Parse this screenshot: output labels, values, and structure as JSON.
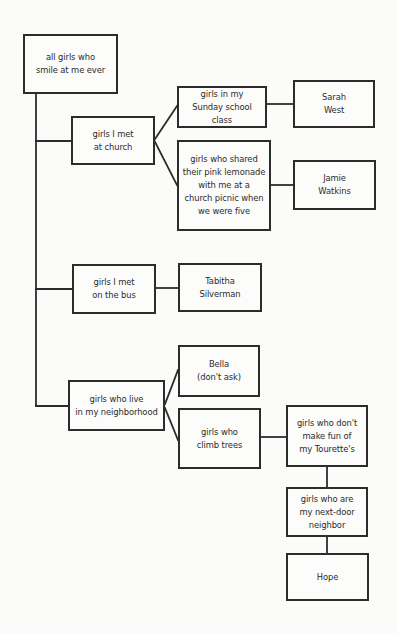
{
  "diagram": {
    "type": "tree",
    "line_color": "#2c2c2c",
    "background_color": "#fbfbf9",
    "nodes": {
      "root": {
        "label": "all girls who\nsmile at me ever",
        "x": 23,
        "y": 34,
        "w": 95,
        "h": 60
      },
      "church": {
        "label": "girls I met\nat church",
        "x": 71,
        "y": 116,
        "w": 84,
        "h": 49
      },
      "sunday_school": {
        "label": "girls in my\nSunday school class",
        "x": 177,
        "y": 86,
        "w": 90,
        "h": 42
      },
      "sarah_west": {
        "label": "Sarah\nWest",
        "x": 293,
        "y": 80,
        "w": 82,
        "h": 48
      },
      "pink_lemonade": {
        "label": "girls who shared\ntheir pink lemonade\nwith me at a\nchurch picnic when\nwe were five",
        "x": 177,
        "y": 140,
        "w": 94,
        "h": 91
      },
      "jamie_watkins": {
        "label": "Jamie\nWatkins",
        "x": 293,
        "y": 160,
        "w": 83,
        "h": 50
      },
      "bus": {
        "label": "girls I met\non the bus",
        "x": 72,
        "y": 264,
        "w": 84,
        "h": 50
      },
      "tabitha_silverman": {
        "label": "Tabitha\nSilverman",
        "x": 178,
        "y": 263,
        "w": 84,
        "h": 49
      },
      "neighborhood": {
        "label": "girls who live\nin my neighborhood",
        "x": 68,
        "y": 380,
        "w": 97,
        "h": 51
      },
      "bella": {
        "label": "Bella\n(don't ask)",
        "x": 178,
        "y": 345,
        "w": 82,
        "h": 52
      },
      "climb_trees": {
        "label": "girls who\nclimb trees",
        "x": 178,
        "y": 408,
        "w": 83,
        "h": 61
      },
      "no_tourettes_fun": {
        "label": "girls who don't\nmake fun of\nmy Tourette's",
        "x": 286,
        "y": 405,
        "w": 82,
        "h": 62
      },
      "next_door": {
        "label": "girls who are\nmy next-door\nneighbor",
        "x": 286,
        "y": 487,
        "w": 82,
        "h": 50
      },
      "hope": {
        "label": "Hope",
        "x": 286,
        "y": 553,
        "w": 83,
        "h": 48
      }
    },
    "edges": [
      [
        "root",
        "church"
      ],
      [
        "root",
        "bus"
      ],
      [
        "root",
        "neighborhood"
      ],
      [
        "church",
        "sunday_school"
      ],
      [
        "church",
        "pink_lemonade"
      ],
      [
        "sunday_school",
        "sarah_west"
      ],
      [
        "pink_lemonade",
        "jamie_watkins"
      ],
      [
        "bus",
        "tabitha_silverman"
      ],
      [
        "neighborhood",
        "bella"
      ],
      [
        "neighborhood",
        "climb_trees"
      ],
      [
        "climb_trees",
        "no_tourettes_fun"
      ],
      [
        "no_tourettes_fun",
        "next_door"
      ],
      [
        "next_door",
        "hope"
      ]
    ],
    "connector_paths": [
      {
        "name": "trunk-root-to-children",
        "points": [
          [
            36,
            94
          ],
          [
            36,
            406
          ]
        ]
      },
      {
        "name": "branch-to-church",
        "points": [
          [
            36,
            141
          ],
          [
            71,
            141
          ]
        ]
      },
      {
        "name": "branch-to-bus",
        "points": [
          [
            36,
            289
          ],
          [
            72,
            289
          ]
        ]
      },
      {
        "name": "branch-to-neighborhood",
        "points": [
          [
            36,
            406
          ],
          [
            68,
            406
          ]
        ]
      },
      {
        "name": "church-to-sunday-school",
        "points": [
          [
            155,
            139
          ],
          [
            177,
            106
          ]
        ]
      },
      {
        "name": "church-to-pink-lemonade",
        "points": [
          [
            155,
            142
          ],
          [
            177,
            185
          ]
        ]
      },
      {
        "name": "sunday-school-to-sarah-west",
        "points": [
          [
            267,
            104
          ],
          [
            293,
            104
          ]
        ]
      },
      {
        "name": "pink-lemonade-to-jamie-watkins",
        "points": [
          [
            271,
            185
          ],
          [
            293,
            185
          ]
        ]
      },
      {
        "name": "bus-to-tabitha-silverman",
        "points": [
          [
            156,
            288
          ],
          [
            178,
            288
          ]
        ]
      },
      {
        "name": "neighborhood-to-bella",
        "points": [
          [
            165,
            404
          ],
          [
            178,
            370
          ]
        ]
      },
      {
        "name": "neighborhood-to-climb-trees",
        "points": [
          [
            165,
            408
          ],
          [
            178,
            440
          ]
        ]
      },
      {
        "name": "climb-trees-to-no-tourettes-fun",
        "points": [
          [
            261,
            437
          ],
          [
            286,
            437
          ]
        ]
      },
      {
        "name": "no-tourettes-fun-to-next-door",
        "points": [
          [
            327,
            467
          ],
          [
            327,
            487
          ]
        ]
      },
      {
        "name": "next-door-to-hope",
        "points": [
          [
            327,
            537
          ],
          [
            327,
            553
          ]
        ]
      }
    ]
  }
}
